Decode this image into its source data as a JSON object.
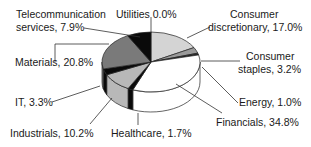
{
  "chart_data": {
    "type": "pie",
    "style": "3d",
    "title": "",
    "start_angle_deg": -90,
    "direction": "clockwise",
    "slices": [
      {
        "label": "Utilities",
        "value": 0.0,
        "text": "Utilities 0.0%",
        "color": "#ffffff"
      },
      {
        "label": "Consumer discretionary",
        "value": 17.0,
        "text": "Consumer discretionary, 17.0%",
        "color": "#d4d4d4"
      },
      {
        "label": "Consumer staples",
        "value": 3.2,
        "text": "Consumer staples, 3.2%",
        "color": "#9a9a9a"
      },
      {
        "label": "Energy",
        "value": 1.0,
        "text": "Energy, 1.0%",
        "color": "#2a2a2a"
      },
      {
        "label": "Financials",
        "value": 34.8,
        "text": "Financials, 34.8%",
        "color": "#ffffff"
      },
      {
        "label": "Healthcare",
        "value": 1.7,
        "text": "Healthcare, 1.7%",
        "color": "#0a0a0a"
      },
      {
        "label": "Industrials",
        "value": 10.2,
        "text": "Industrials, 10.2%",
        "color": "#b8b8b8"
      },
      {
        "label": "IT",
        "value": 3.3,
        "text": "IT, 3.3%",
        "color": "#0a0a0a"
      },
      {
        "label": "Materials",
        "value": 20.8,
        "text": "Materials, 20.8%",
        "color": "#7a7a7a"
      },
      {
        "label": "Telecommunication services",
        "value": 7.9,
        "text": "Telecommunication services, 7.9%",
        "color": "#0a0a0a"
      }
    ]
  },
  "labels": {
    "telecom_line1": "Telecommunication",
    "telecom_line2": "services, 7.9%",
    "utilities": "Utilities 0.0%",
    "cons_disc_line1": "Consumer",
    "cons_disc_line2": "discretionary, 17.0%",
    "cons_staples_line1": "Consumer",
    "cons_staples_line2": "staples, 3.2%",
    "energy": "Energy, 1.0%",
    "financials": "Financials, 34.8%",
    "healthcare": "Healthcare, 1.7%",
    "industrials": "Industrials, 10.2%",
    "it": "IT, 3.3%",
    "materials": "Materials, 20.8%"
  }
}
